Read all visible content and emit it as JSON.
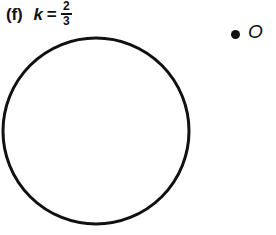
{
  "figure": {
    "background_color": "#ffffff",
    "ink_color": "#111111",
    "caption": {
      "label": "(f)",
      "variable": "k",
      "relation": "=",
      "fraction": {
        "numerator": "2",
        "denominator": "3"
      }
    },
    "center_point": {
      "marker_icon": "filled-dot-icon",
      "label": "O"
    },
    "circle": {
      "stroke_color": "#111111",
      "stroke_width": 3,
      "fill": "none",
      "center_x": 96,
      "center_y": 95,
      "radius": 93
    }
  }
}
